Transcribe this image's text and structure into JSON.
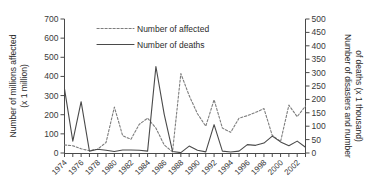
{
  "chart_data": {
    "type": "line",
    "title": "",
    "xlabel": "",
    "ylabel": "Number of millions affected (x 1 million)",
    "ylabel_line1": "Number of millions affected",
    "ylabel_line2": "(x 1 million)",
    "y2label": "Number of disasters and number of deaths (x 1 thousand)",
    "y2label_line1": "Number of disasters and number",
    "y2label_line2": "of deaths (x 1 thousand)",
    "grid": false,
    "legend_position": "top-left-inside",
    "ylim": [
      0,
      700
    ],
    "y2lim": [
      0,
      500
    ],
    "yticks": [
      0,
      100,
      200,
      300,
      400,
      500,
      600,
      700
    ],
    "y2ticks": [
      0,
      50,
      100,
      150,
      200,
      250,
      300,
      350,
      400,
      450,
      500
    ],
    "ytick_labels": [
      "0",
      "100",
      "200",
      "300",
      "400",
      "500",
      "600",
      "700"
    ],
    "y2tick_labels": [
      "0",
      "50",
      "100",
      "150",
      "200",
      "250",
      "300",
      "350",
      "400",
      "450",
      "500"
    ],
    "x": [
      1974,
      1975,
      1976,
      1977,
      1978,
      1979,
      1980,
      1981,
      1982,
      1983,
      1984,
      1985,
      1986,
      1987,
      1988,
      1989,
      1990,
      1991,
      1992,
      1993,
      1994,
      1995,
      1996,
      1997,
      1998,
      1999,
      2000,
      2001,
      2002,
      2003
    ],
    "xtick_labels": [
      "1974",
      "1976",
      "1978",
      "1980",
      "1982",
      "1984",
      "1986",
      "1988",
      "1990",
      "1992",
      "1994",
      "1996",
      "1998",
      "2000",
      "2002"
    ],
    "xtick_values": [
      1974,
      1976,
      1978,
      1980,
      1982,
      1984,
      1986,
      1988,
      1990,
      1992,
      1994,
      1996,
      1998,
      2000,
      2002
    ],
    "series": [
      {
        "name": "Number of affected",
        "style": "dotted",
        "color": "#7d7d7d",
        "axis": "left",
        "values": [
          42,
          38,
          22,
          12,
          20,
          55,
          240,
          90,
          72,
          150,
          182,
          130,
          42,
          6,
          415,
          300,
          205,
          140,
          278,
          130,
          108,
          182,
          195,
          212,
          232,
          92,
          60,
          250,
          190,
          245
        ]
      },
      {
        "name": "Number of deaths",
        "style": "solid",
        "color": "#4a4a4a",
        "axis": "left",
        "values": [
          335,
          62,
          268,
          10,
          20,
          14,
          8,
          16,
          16,
          14,
          10,
          452,
          202,
          8,
          2,
          36,
          14,
          6,
          148,
          10,
          5,
          10,
          44,
          40,
          52,
          88,
          58,
          38,
          62,
          30
        ]
      }
    ],
    "legend": [
      {
        "label": "Number of affected",
        "style": "dotted"
      },
      {
        "label": "Number of deaths",
        "style": "solid"
      }
    ],
    "note_right_axis_scale": "affected plotted on left 0-700 scale; right axis 0-500 is parallel scale for disasters/deaths"
  }
}
